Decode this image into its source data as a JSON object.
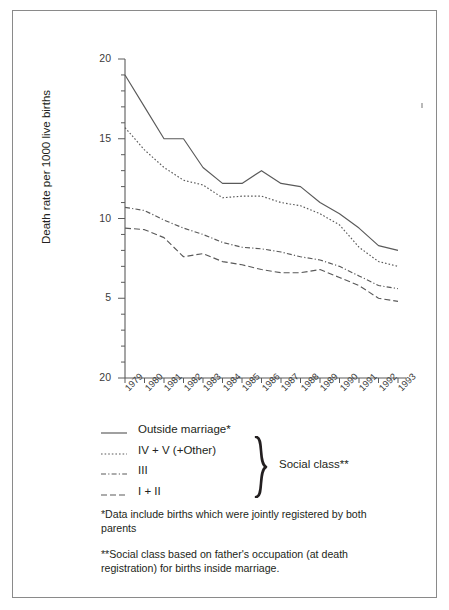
{
  "chart_data": {
    "type": "line",
    "title": "",
    "xlabel": "",
    "ylabel": "Death rate per 1000 live births",
    "grid": false,
    "legend_position": "below-plot",
    "xlim": [
      1979,
      1993
    ],
    "ylim": [
      0,
      20
    ],
    "yticks": [
      5,
      10,
      15,
      20
    ],
    "ytick_labels": [
      "5",
      "10",
      "15",
      "20"
    ],
    "y_axis_bottom_label": "20",
    "categories": [
      1979,
      1980,
      1981,
      1982,
      1983,
      1984,
      1985,
      1986,
      1987,
      1988,
      1989,
      1990,
      1991,
      1992,
      1993
    ],
    "xtick_labels": [
      "1979",
      "1980",
      "1981",
      "1982",
      "1983",
      "1984",
      "1985",
      "1986",
      "1987",
      "1988",
      "1989",
      "1990",
      "1991",
      "1992",
      "1993"
    ],
    "series": [
      {
        "name": "Outside marriage*",
        "style": "solid",
        "values": [
          19.0,
          17.0,
          15.0,
          15.0,
          13.2,
          12.2,
          12.2,
          13.0,
          12.2,
          12.0,
          11.0,
          10.3,
          9.4,
          8.3,
          8.0
        ]
      },
      {
        "name": "IV + V (+Other)",
        "style": "dotted",
        "values": [
          15.7,
          14.3,
          13.2,
          12.4,
          12.1,
          11.3,
          11.4,
          11.4,
          11.0,
          10.8,
          10.3,
          9.6,
          8.2,
          7.3,
          7.0
        ]
      },
      {
        "name": "III",
        "style": "dash-dot",
        "values": [
          10.7,
          10.5,
          9.9,
          9.4,
          9.0,
          8.5,
          8.2,
          8.1,
          7.9,
          7.6,
          7.4,
          7.0,
          6.4,
          5.8,
          5.6
        ]
      },
      {
        "name": "I + II",
        "style": "long-dash",
        "values": [
          9.4,
          9.3,
          8.8,
          7.6,
          7.8,
          7.3,
          7.1,
          6.8,
          6.6,
          6.6,
          6.8,
          6.3,
          5.8,
          5.0,
          4.8
        ]
      }
    ]
  },
  "legend": {
    "items": [
      {
        "label": "Outside marriage*",
        "style": "solid"
      },
      {
        "label": "IV + V (+Other)",
        "style": "dotted"
      },
      {
        "label": "III",
        "style": "dash-dot"
      },
      {
        "label": "I + II",
        "style": "long-dash"
      }
    ],
    "group_label": "Social class**"
  },
  "footnotes": {
    "first": "*Data include births which were jointly registered by both parents",
    "second": "**Social class based on father's occupation (at death registration) for births inside marriage."
  }
}
